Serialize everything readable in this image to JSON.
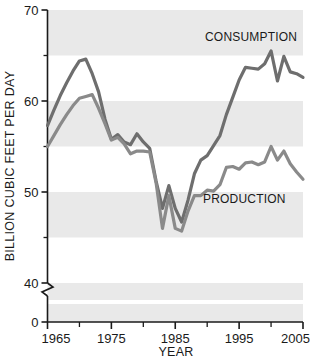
{
  "chart_data": {
    "type": "line",
    "title": "",
    "xlabel": "YEAR",
    "ylabel": "BILLION CUBIC FEET PER DAY",
    "xlim": [
      1965,
      2005
    ],
    "ylim": [
      40,
      70
    ],
    "y_axis_break": true,
    "y_break_from": 0,
    "y_break_to": 40,
    "grid": false,
    "banded_background": true,
    "band_color": "#e9e9e9",
    "legend_position": "inline-annotations",
    "x_ticks_major": [
      1965,
      1975,
      1985,
      1995,
      2005
    ],
    "x_ticks_minor": [
      1970,
      1980,
      1990,
      2000
    ],
    "x_tick_labels": [
      "1965",
      "1975",
      "1985",
      "1995",
      "2005"
    ],
    "y_ticks_major": [
      0,
      40,
      50,
      60,
      70
    ],
    "y_ticks_minor": [
      45,
      55,
      65
    ],
    "y_tick_labels": [
      "0",
      "40",
      "50",
      "60",
      "70"
    ],
    "line_color": "#6e6e6e",
    "series": [
      {
        "name": "CONSUMPTION",
        "label": "CONSUMPTION",
        "color": "#6e6e6e",
        "x": [
          1965,
          1966,
          1967,
          1968,
          1969,
          1970,
          1971,
          1972,
          1973,
          1974,
          1975,
          1976,
          1977,
          1978,
          1979,
          1980,
          1981,
          1982,
          1983,
          1984,
          1985,
          1986,
          1987,
          1988,
          1989,
          1990,
          1991,
          1992,
          1993,
          1994,
          1995,
          1996,
          1997,
          1998,
          1999,
          2000,
          2001,
          2002,
          2003,
          2004,
          2005
        ],
        "values": [
          57.3,
          59.0,
          60.6,
          62.0,
          63.3,
          64.4,
          64.6,
          63.0,
          61.0,
          58.0,
          55.8,
          56.3,
          55.5,
          55.2,
          56.4,
          55.5,
          54.8,
          51.2,
          48.2,
          50.7,
          48.2,
          46.7,
          49.1,
          52.0,
          53.5,
          54.0,
          55.1,
          56.2,
          58.5,
          60.4,
          62.3,
          63.7,
          63.6,
          63.5,
          64.1,
          65.5,
          62.2,
          64.9,
          63.2,
          63.0,
          62.6
        ]
      },
      {
        "name": "PRODUCTION",
        "label": "PRODUCTION",
        "color": "#8a8a8a",
        "x": [
          1965,
          1966,
          1967,
          1968,
          1969,
          1970,
          1971,
          1972,
          1973,
          1974,
          1975,
          1976,
          1977,
          1978,
          1979,
          1980,
          1981,
          1982,
          1983,
          1984,
          1985,
          1986,
          1987,
          1988,
          1989,
          1990,
          1991,
          1992,
          1993,
          1994,
          1995,
          1996,
          1997,
          1998,
          1999,
          2000,
          2001,
          2002,
          2003,
          2004,
          2005
        ],
        "values": [
          55.0,
          56.2,
          57.4,
          58.5,
          59.5,
          60.3,
          60.5,
          60.7,
          59.2,
          57.5,
          55.7,
          56.0,
          55.3,
          54.2,
          54.5,
          54.5,
          54.4,
          51.0,
          46.0,
          49.6,
          46.0,
          45.7,
          47.9,
          49.6,
          49.6,
          50.2,
          50.1,
          50.8,
          52.7,
          52.8,
          52.5,
          53.2,
          53.3,
          53.0,
          53.3,
          55.0,
          53.5,
          54.5,
          53.1,
          52.2,
          51.4
        ]
      }
    ],
    "annotations": [
      {
        "text": "CONSUMPTION",
        "x_px": 205,
        "y_px": 41
      },
      {
        "text": "PRODUCTION",
        "x_px": 203,
        "y_px": 203
      }
    ]
  },
  "axes": {
    "y_title": "BILLION CUBIC FEET PER DAY",
    "x_title": "YEAR"
  }
}
